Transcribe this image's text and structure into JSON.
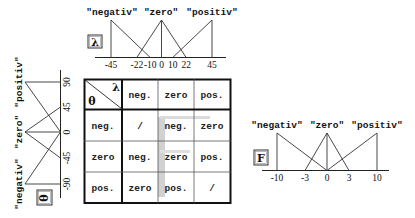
{
  "lambda_chart": {
    "variable": "λ",
    "labels": [
      "\"negativ\"",
      "\"zero\"",
      "\"positiv\""
    ],
    "ticks": [
      "-45",
      "-22",
      "-10",
      "0",
      "10",
      "22",
      "45"
    ],
    "sets": [
      {
        "name": "negativ",
        "points": [
          [
            -45,
            1
          ],
          [
            -45,
            0
          ],
          [
            -10,
            0
          ]
        ],
        "peak": -45,
        "zero_at": -10
      },
      {
        "name": "zero",
        "left": -22,
        "peak": 0,
        "right": 22
      },
      {
        "name": "positiv",
        "points": [
          [
            10,
            0
          ],
          [
            45,
            1
          ],
          [
            45,
            0
          ]
        ],
        "peak": 45,
        "zero_at": 10
      }
    ]
  },
  "theta_chart": {
    "variable": "θ",
    "labels": [
      "\"negativ\"",
      "\"zero\"",
      "\"positiv\""
    ],
    "ticks": [
      "-90",
      "-45",
      "0",
      "45",
      "90"
    ],
    "sets": [
      {
        "name": "negativ",
        "peak": -90,
        "zero_at": 0
      },
      {
        "name": "zero",
        "left": -45,
        "peak": 0,
        "right": 45
      },
      {
        "name": "positiv",
        "peak": 90,
        "zero_at": 0
      }
    ]
  },
  "force_chart": {
    "variable": "F",
    "labels": [
      "\"negativ\"",
      "\"zero\"",
      "\"positiv\""
    ],
    "ticks": [
      "-10",
      "-3",
      "0",
      "3",
      "10"
    ],
    "sets": [
      {
        "name": "negativ",
        "peak": -10,
        "zero_at": 0
      },
      {
        "name": "zero",
        "left": -3,
        "peak": 0,
        "right": 3
      },
      {
        "name": "positiv",
        "peak": 10,
        "zero_at": 0
      }
    ]
  },
  "rule_table": {
    "corner_col_var": "λ",
    "corner_row_var": "θ",
    "col_headers": [
      "neg.",
      "zero",
      "pos."
    ],
    "rows": [
      {
        "header": "neg.",
        "cells": [
          "/",
          "neg.",
          "zero"
        ]
      },
      {
        "header": "zero",
        "cells": [
          "neg.",
          "zero",
          "pos."
        ]
      },
      {
        "header": "pos.",
        "cells": [
          "zero",
          "pos.",
          "/"
        ]
      }
    ]
  }
}
